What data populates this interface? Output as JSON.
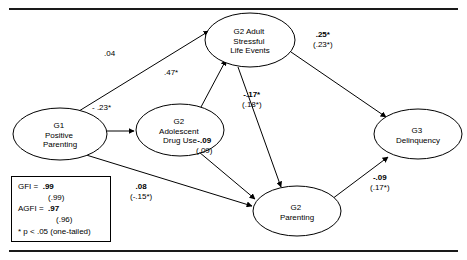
{
  "figure": {
    "type": "path-diagram",
    "title": "",
    "rules": {
      "top": true,
      "bottom": true
    }
  },
  "nodes": [
    {
      "id": "g1_positive_parenting",
      "label": "G1\nPositive\nParenting",
      "lines": [
        "G1",
        "Positive",
        "Parenting"
      ],
      "cx": 60,
      "cy": 134,
      "rx": 47,
      "ry": 26
    },
    {
      "id": "g2_adolescent_drug_use",
      "label": "G2\nAdolescent\nDrug Use",
      "lines": [
        "G2",
        "Adolescent",
        "Drug Use"
      ],
      "cx": 180,
      "cy": 130,
      "rx": 44,
      "ry": 26
    },
    {
      "id": "g2_adult_stressful_life_events",
      "label": "G2 Adult\nStressful\nLife Events",
      "lines": [
        "G2 Adult",
        "Stressful",
        "Life Events"
      ],
      "cx": 250,
      "cy": 40,
      "rx": 45,
      "ry": 27
    },
    {
      "id": "g2_parenting",
      "label": "G2\nParenting",
      "lines": [
        "G2",
        "Parenting"
      ],
      "cx": 297,
      "cy": 211,
      "rx": 44,
      "ry": 25
    },
    {
      "id": "g3_delinquency",
      "label": "G3\nDelinquency",
      "lines": [
        "G3",
        "Delinquency"
      ],
      "cx": 418,
      "cy": 134,
      "rx": 44,
      "ry": 25
    }
  ],
  "paths": [
    {
      "id": "p_g1_to_stress",
      "from": "g1_positive_parenting",
      "to": "g2_adult_stressful_life_events",
      "coefficient": ".04",
      "coefficient_paren": "",
      "significant": false,
      "label_x": 113,
      "label_y": 54
    },
    {
      "id": "p_g1_to_drug",
      "from": "g1_positive_parenting",
      "to": "g2_adolescent_drug_use",
      "coefficient": "- .23*",
      "coefficient_paren": "",
      "significant": true,
      "label_x": 102,
      "label_y": 108
    },
    {
      "id": "p_drug_to_stress",
      "from": "g2_adolescent_drug_use",
      "to": "g2_adult_stressful_life_events",
      "coefficient": ".47*",
      "coefficient_paren": "",
      "significant": true,
      "label_x": 173,
      "label_y": 73
    },
    {
      "id": "p_stress_to_delinquency",
      "from": "g2_adult_stressful_life_events",
      "to": "g3_delinquency",
      "coefficient": ".25*",
      "coefficient_paren": "(.23*)",
      "significant": true,
      "label_x": 325,
      "label_y": 36
    },
    {
      "id": "p_stress_to_parenting",
      "from": "g2_adult_stressful_life_events",
      "to": "g2_parenting",
      "coefficient": "-.17*",
      "coefficient_paren": "(.18*)",
      "significant": true,
      "label_x": 254,
      "label_y": 96
    },
    {
      "id": "p_drug_to_parenting",
      "from": "g2_adolescent_drug_use",
      "to": "g2_parenting",
      "coefficient": "-.09",
      "coefficient_paren": "(.09)",
      "significant": false,
      "label_x": 205,
      "label_y": 142
    },
    {
      "id": "p_g1_to_parenting",
      "from": "g1_positive_parenting",
      "to": "g2_parenting",
      "coefficient": ".08",
      "coefficient_paren": "(-.15*)",
      "significant": false,
      "label_x": 144,
      "label_y": 188
    },
    {
      "id": "p_parenting_to_delinquency",
      "from": "g2_parenting",
      "to": "g3_delinquency",
      "coefficient": "-.09",
      "coefficient_paren": "(.17*)",
      "significant": false,
      "label_x": 381,
      "label_y": 179
    }
  ],
  "fit_box": {
    "gfi_label": "GFI =",
    "gfi_value": ".99",
    "gfi_paren": "(.99)",
    "agfi_label": "AGFI =",
    "agfi_value": ".97",
    "agfi_paren": "(.96)",
    "note": "* p < .05 (one-tailed)"
  }
}
